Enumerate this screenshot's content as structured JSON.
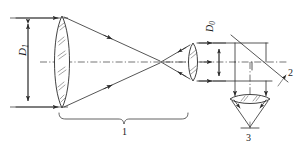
{
  "figure": {
    "background_color": "#ffffff",
    "line_color": "#2b2b2b",
    "width": 304,
    "height": 149
  },
  "labels": {
    "d1": "D",
    "d1_sub": "1",
    "d0": "D",
    "d0_sub": "0",
    "item_1": "1",
    "item_2": "2",
    "item_3": "3"
  },
  "components": [
    {
      "id": "objective-lens",
      "label": "D1",
      "type": "biconvex-lens",
      "role": "large objective lens",
      "aperture_label": "D1",
      "center_x": 62,
      "center_y": 62,
      "half_height": 46,
      "half_width": 9
    },
    {
      "id": "collimating-lens",
      "label": "",
      "type": "biconvex-lens",
      "role": "small collimating eyepiece lens",
      "center_x": 193,
      "center_y": 62,
      "half_height": 19,
      "half_width": 5
    },
    {
      "id": "beam-splitter",
      "label": "2",
      "type": "tilted-plate",
      "role": "45 degree beam splitter / folding mirror",
      "x1": 231,
      "y1": 35,
      "x2": 285,
      "y2": 80
    },
    {
      "id": "focusing-lens",
      "label": "",
      "type": "biconvex-lens-horizontal",
      "role": "detector focusing lens",
      "center_x": 250,
      "center_y": 99,
      "half_width": 20,
      "half_height": 5
    },
    {
      "id": "detector",
      "label": "3",
      "type": "detector",
      "role": "photodetector at focus",
      "x": 250,
      "y": 128
    },
    {
      "id": "telescope-assembly",
      "label": "1",
      "type": "bracket-group",
      "role": "beam expander telescope assembly",
      "span_x1": 60,
      "span_x2": 187,
      "y": 113
    }
  ],
  "dimensions": [
    {
      "id": "D1",
      "name": "input aperture diameter",
      "orientation": "vertical",
      "x": 28,
      "y_top": 18,
      "y_bottom": 107
    },
    {
      "id": "D0",
      "name": "output beam diameter",
      "orientation": "vertical",
      "x": 219,
      "y_top": 43,
      "y_bottom": 81
    }
  ],
  "optical_axis": {
    "type": "dash-dot",
    "y": 62,
    "x_start": 40,
    "x_end": 286
  },
  "rays": {
    "description": "Collimated input converges through objective to focus, diverges to collimating lens, exits collimated, folds at beam splitter down to focusing lens and detector",
    "focus_x": 160,
    "focus_y": 62
  }
}
